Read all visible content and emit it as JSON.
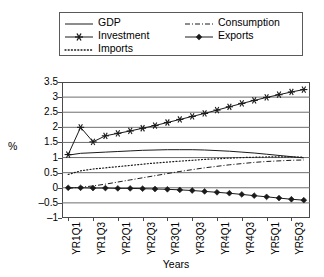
{
  "chart_data": {
    "type": "line",
    "title": "",
    "xlabel": "Years",
    "ylabel": "%",
    "ylim": [
      -1,
      3.5
    ],
    "yticks": [
      3.5,
      3,
      2.5,
      2,
      1.5,
      1,
      0.5,
      0,
      -0.5,
      -1
    ],
    "ytick_labels": [
      "3.5",
      "3",
      "2.5",
      "2",
      "1.5",
      "1",
      "0.5",
      "0",
      "-0.5",
      "-1"
    ],
    "grid": true,
    "legend_position": "top",
    "x": [
      "YR1Q1",
      "YR1Q2",
      "YR1Q3",
      "YR1Q4",
      "YR2Q1",
      "YR2Q2",
      "YR2Q3",
      "YR2Q4",
      "YR3Q1",
      "YR3Q2",
      "YR3Q3",
      "YR3Q4",
      "YR4Q1",
      "YR4Q2",
      "YR4Q3",
      "YR4Q4",
      "YR5Q1",
      "YR5Q2",
      "YR5Q3",
      "YR5Q4"
    ],
    "xtick_labels": [
      "YR1Q1",
      "YR1Q3",
      "YR2Q1",
      "YR2Q3",
      "YR3Q1",
      "YR3Q3",
      "YR4Q1",
      "YR4Q3",
      "YR5Q1",
      "YR5Q3"
    ],
    "series": [
      {
        "name": "GDP",
        "style": "solid",
        "marker": "none",
        "color": "#1a1a1a",
        "values": [
          1.08,
          1.14,
          1.16,
          1.18,
          1.2,
          1.22,
          1.24,
          1.25,
          1.26,
          1.26,
          1.26,
          1.25,
          1.23,
          1.21,
          1.18,
          1.15,
          1.11,
          1.07,
          1.03,
          0.99
        ]
      },
      {
        "name": "Investment",
        "style": "solid",
        "marker": "asterisk",
        "color": "#1a1a1a",
        "values": [
          1.1,
          2.0,
          1.52,
          1.72,
          1.8,
          1.88,
          1.97,
          2.06,
          2.16,
          2.26,
          2.36,
          2.46,
          2.57,
          2.68,
          2.79,
          2.89,
          2.99,
          3.08,
          3.17,
          3.25
        ]
      },
      {
        "name": "Imports",
        "style": "dotted",
        "marker": "none",
        "color": "#1a1a1a",
        "values": [
          0.44,
          0.56,
          0.62,
          0.66,
          0.7,
          0.74,
          0.78,
          0.82,
          0.85,
          0.88,
          0.91,
          0.94,
          0.96,
          0.98,
          1.0,
          1.01,
          1.02,
          1.02,
          1.02,
          1.01
        ]
      },
      {
        "name": "Consumption",
        "style": "dashdot",
        "marker": "none",
        "color": "#1a1a1a",
        "values": [
          -0.02,
          0.02,
          0.06,
          0.12,
          0.19,
          0.26,
          0.33,
          0.4,
          0.47,
          0.54,
          0.6,
          0.66,
          0.71,
          0.76,
          0.8,
          0.84,
          0.87,
          0.89,
          0.91,
          0.92
        ]
      },
      {
        "name": "Exports",
        "style": "solid",
        "marker": "diamond",
        "color": "#1a1a1a",
        "values": [
          0.0,
          0.0,
          -0.01,
          -0.01,
          -0.02,
          -0.02,
          -0.03,
          -0.04,
          -0.05,
          -0.07,
          -0.09,
          -0.12,
          -0.15,
          -0.18,
          -0.22,
          -0.26,
          -0.3,
          -0.34,
          -0.38,
          -0.41
        ]
      }
    ]
  },
  "legend": {
    "left_entries": [
      {
        "label": "GDP",
        "style": "solid",
        "marker": "none"
      },
      {
        "label": "Investment",
        "style": "solid",
        "marker": "asterisk"
      },
      {
        "label": "Imports",
        "style": "dotted",
        "marker": "none"
      }
    ],
    "right_entries": [
      {
        "label": "Consumption",
        "style": "dashdot",
        "marker": "none"
      },
      {
        "label": "Exports",
        "style": "solid",
        "marker": "diamond"
      }
    ]
  },
  "axes": {
    "ylabel": "%",
    "xlabel": "Years"
  }
}
